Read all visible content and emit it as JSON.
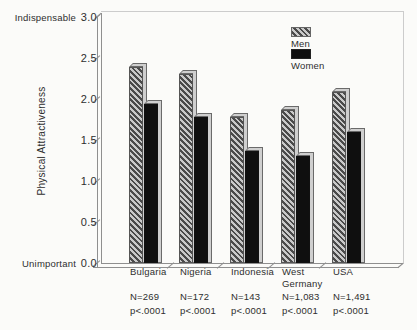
{
  "chart_data": {
    "type": "bar",
    "title": "",
    "ylabel": "Physical Attractiveness",
    "y_axis_top_label": "Indispensable",
    "y_axis_bottom_label": "Unimportant",
    "ylim": [
      0,
      3
    ],
    "yticks": [
      {
        "value": 3.0,
        "label": "3.0"
      },
      {
        "value": 2.5,
        "label": "2.5"
      },
      {
        "value": 2.0,
        "label": "2.0"
      },
      {
        "value": 1.5,
        "label": "1.5"
      },
      {
        "value": 1.0,
        "label": "1.0"
      },
      {
        "value": 0.5,
        "label": "0.5"
      },
      {
        "value": 0.0,
        "label": "0.0"
      }
    ],
    "categories": [
      "Bulgaria",
      "Nigeria",
      "Indonesia",
      "West Germany",
      "USA"
    ],
    "sample_sizes": [
      "N=269",
      "N=172",
      "N=143",
      "N=1,083",
      "N=1,491"
    ],
    "p_values": [
      "p<.0001",
      "p<.0001",
      "p<.0001",
      "p<.0001",
      "p<.0001"
    ],
    "series": [
      {
        "name": "Men",
        "style": "hatched",
        "values": [
          2.39,
          2.3,
          1.78,
          1.87,
          2.08
        ]
      },
      {
        "name": "Women",
        "style": "solid-black",
        "values": [
          1.94,
          1.78,
          1.37,
          1.3,
          1.6
        ]
      }
    ],
    "legend_position": "top-right-inside",
    "grid": false
  },
  "colors": {
    "background": "#fbfbf9",
    "text": "#2e2e2e",
    "axis_line": "#8f8f8f",
    "frame_line": "#cccccc",
    "hatch_dark": "#4a4a4a",
    "hatch_light": "#c9c9c9",
    "women_bar": "#0f0f0f",
    "bar_side_face": "#cfcfcf",
    "bar_edge": "#6a6a6a"
  }
}
